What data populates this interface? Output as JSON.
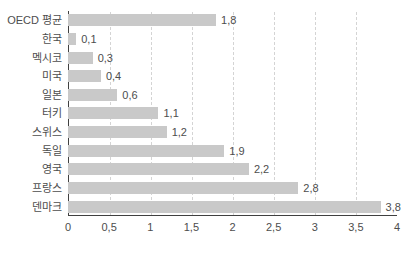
{
  "chart_data": {
    "type": "bar",
    "orientation": "horizontal",
    "title": "",
    "xlabel": "",
    "ylabel": "",
    "categories": [
      "OECD 평균",
      "한국",
      "멕시코",
      "미국",
      "일본",
      "터키",
      "스위스",
      "독일",
      "영국",
      "프랑스",
      "덴마크"
    ],
    "values": [
      1.8,
      0.1,
      0.3,
      0.4,
      0.6,
      1.1,
      1.2,
      1.9,
      2.2,
      2.8,
      3.8
    ],
    "value_labels": [
      "1,8",
      "0,1",
      "0,3",
      "0,4",
      "0,6",
      "1,1",
      "1,2",
      "1,9",
      "2,2",
      "2,8",
      "3,8"
    ],
    "xlim": [
      0,
      4
    ],
    "xticks": [
      0,
      0.5,
      1,
      1.5,
      2,
      2.5,
      3,
      3.5,
      4
    ],
    "xtick_labels": [
      "0",
      "0,5",
      "1",
      "1,5",
      "2",
      "2,5",
      "3",
      "3,5",
      "4"
    ],
    "grid_ticks": [
      0.5,
      1,
      1.5,
      2,
      2.5,
      3,
      3.5
    ],
    "grid": "vertical-dashed",
    "legend": "none",
    "colors": {
      "bar": "#c9c9c9",
      "axis": "#404040",
      "gridline": "#d4d4d4",
      "text": "#4d4d4d",
      "background": "#ffffff"
    }
  }
}
